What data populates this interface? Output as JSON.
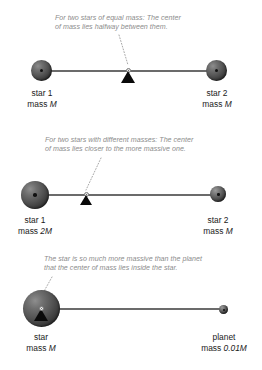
{
  "figure": {
    "background_color": "#ffffff",
    "caption_color": "#8c8c8c",
    "label_color": "#1a1a1a",
    "bar_color": "#6b6b6b",
    "fulcrum_color": "#0a0a0a"
  },
  "panels": [
    {
      "id": "equal-mass",
      "caption": {
        "line1": "For two stars of equal mass: The center",
        "line2": "of mass lies halfway between them."
      },
      "left": {
        "name": "star 1",
        "mass_prefix": "mass ",
        "mass_value": "M"
      },
      "right": {
        "name": "star 2",
        "mass_prefix": "mass ",
        "mass_value": "M"
      },
      "center_of_mass_position": "halfway"
    },
    {
      "id": "different-mass",
      "caption": {
        "line1": "For two stars with different masses: The center",
        "line2": "of mass lies closer to the more massive one."
      },
      "left": {
        "name": "star 1",
        "mass_prefix": "mass ",
        "mass_value": "2M"
      },
      "right": {
        "name": "star 2",
        "mass_prefix": "mass ",
        "mass_value": "M"
      },
      "center_of_mass_position": "closer to massive star"
    },
    {
      "id": "star-planet",
      "caption": {
        "line1": "The star is so much more massive than the planet",
        "line2": "that the center of mass lies inside the star."
      },
      "left": {
        "name": "star",
        "mass_prefix": "mass ",
        "mass_value": "M"
      },
      "right": {
        "name": "planet",
        "mass_prefix": "mass ",
        "mass_value": "0.01M"
      },
      "center_of_mass_position": "inside the star"
    }
  ]
}
